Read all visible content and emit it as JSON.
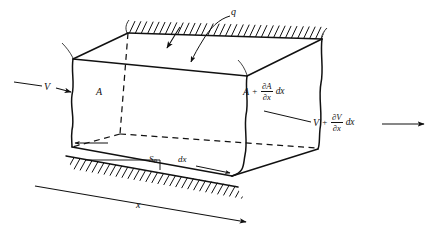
{
  "figure": {
    "background_color": "#ffffff",
    "ink_color": "#111111"
  },
  "labels": {
    "lateral_inflow": "q",
    "inflow_velocity": "V",
    "inflow_area": "A",
    "outflow_area_term": "A",
    "outflow_area_plus": "+",
    "outflow_area_num": "∂A",
    "outflow_area_den": "∂x",
    "outflow_area_tail": "dx",
    "outflow_velocity_term": "V",
    "outflow_velocity_plus": "+",
    "outflow_velocity_num": "∂V",
    "outflow_velocity_den": "∂x",
    "outflow_velocity_tail": "dx",
    "bed_slope": "S",
    "bed_slope_sub": "0",
    "element_length": "dx",
    "axis_x": "x"
  },
  "geometry": {
    "front_top_left": [
      73,
      59
    ],
    "front_top_right": [
      247,
      76
    ],
    "back_top_left": [
      128,
      33
    ],
    "back_top_right": [
      322,
      39
    ],
    "front_bottom_left": [
      72,
      146
    ],
    "front_bottom_right": [
      232,
      175
    ],
    "back_bottom_left": [
      120,
      134
    ],
    "back_bottom_right": [
      318,
      148
    ],
    "right_face_top_right": [
      322,
      39
    ],
    "right_face_bottom_right": [
      318,
      148
    ]
  }
}
